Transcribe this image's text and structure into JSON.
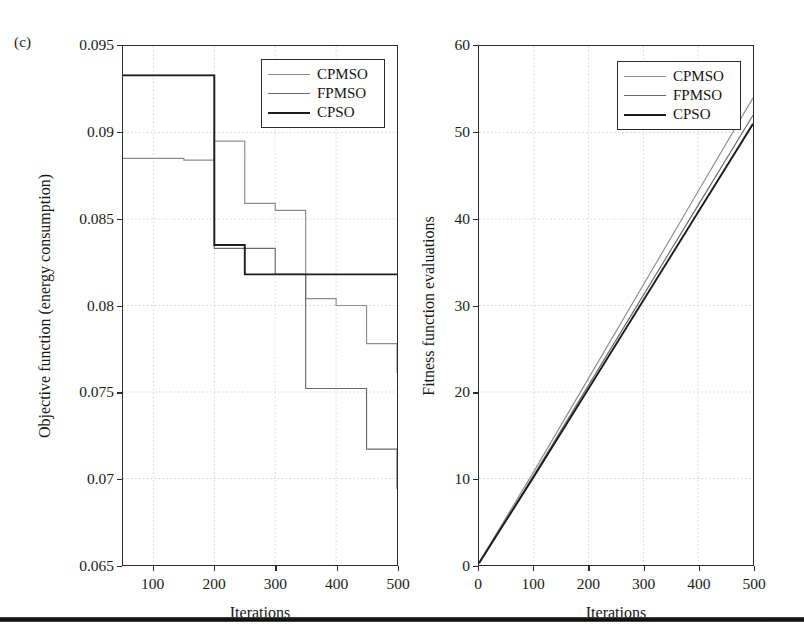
{
  "figure": {
    "subfigure_label": "(c)",
    "background": "#ffffff",
    "rule_color": "#111111"
  },
  "legend": {
    "entries": [
      {
        "label": "CPMSO",
        "color": "#8d8d8d",
        "width": 1.3
      },
      {
        "label": "FPMSO",
        "color": "#6a6a6a",
        "width": 1.3
      },
      {
        "label": "CPSO",
        "color": "#1d1d1d",
        "width": 2.6
      }
    ]
  },
  "chart_data": [
    {
      "id": "objective-function",
      "type": "line",
      "drawstyle": "steps-post",
      "title": "",
      "subfigure": "(c)",
      "xlabel": "Iterations",
      "ylabel": "Objective function (energy consumption)",
      "xlim": [
        50,
        500
      ],
      "ylim": [
        0.065,
        0.095
      ],
      "xticks": [
        100,
        200,
        300,
        400,
        500
      ],
      "xticklabels": [
        "100",
        "200",
        "300",
        "400",
        "500"
      ],
      "yticks": [
        0.065,
        0.07,
        0.075,
        0.08,
        0.085,
        0.09,
        0.095
      ],
      "yticklabels": [
        "0.065",
        "0.07",
        "0.075",
        "0.08",
        "0.085",
        "0.09",
        "0.095"
      ],
      "grid": true,
      "legend_position": "upper right",
      "series": [
        {
          "name": "CPMSO",
          "color": "#8d8d8d",
          "x": [
            50,
            150,
            200,
            250,
            300,
            350,
            400,
            450,
            500
          ],
          "y": [
            0.0885,
            0.0884,
            0.0895,
            0.0859,
            0.0855,
            0.0804,
            0.08,
            0.0778,
            0.0761
          ]
        },
        {
          "name": "FPMSO",
          "color": "#6a6a6a",
          "x": [
            50,
            200,
            250,
            300,
            350,
            400,
            450,
            500
          ],
          "y": [
            0.0933,
            0.0833,
            0.0833,
            0.0818,
            0.0752,
            0.0752,
            0.0717,
            0.0694
          ]
        },
        {
          "name": "CPSO",
          "color": "#1d1d1d",
          "x": [
            50,
            200,
            250,
            500
          ],
          "y": [
            0.0933,
            0.0835,
            0.0818,
            0.0818
          ]
        }
      ]
    },
    {
      "id": "fitness-function-evaluations",
      "type": "line",
      "drawstyle": "default",
      "title": "",
      "xlabel": "Iterations",
      "ylabel": "Fitness function evaluations",
      "xlim": [
        0,
        500
      ],
      "ylim": [
        0,
        60
      ],
      "xticks": [
        0,
        100,
        200,
        300,
        400,
        500
      ],
      "xticklabels": [
        "0",
        "100",
        "200",
        "300",
        "400",
        "500"
      ],
      "yticks": [
        0,
        10,
        20,
        30,
        40,
        50,
        60
      ],
      "yticklabels": [
        "0",
        "10",
        "20",
        "30",
        "40",
        "50",
        "60"
      ],
      "grid": true,
      "legend_position": "upper right",
      "series": [
        {
          "name": "CPMSO",
          "color": "#8d8d8d",
          "x": [
            0,
            100,
            200,
            300,
            400,
            500
          ],
          "y": [
            0.3,
            10.8,
            21.6,
            32.4,
            43.2,
            54.0
          ]
        },
        {
          "name": "FPMSO",
          "color": "#6a6a6a",
          "x": [
            0,
            100,
            200,
            300,
            400,
            500
          ],
          "y": [
            0.2,
            10.4,
            20.8,
            31.2,
            41.6,
            52.0
          ]
        },
        {
          "name": "CPSO",
          "color": "#1d1d1d",
          "x": [
            0,
            100,
            200,
            300,
            400,
            500
          ],
          "y": [
            0.2,
            10.2,
            20.4,
            30.6,
            40.8,
            51.0
          ]
        }
      ]
    }
  ]
}
